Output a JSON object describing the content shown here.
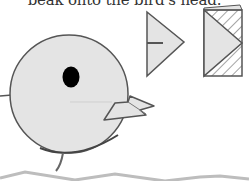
{
  "caption": {
    "text": "beak onto the bird's head."
  },
  "illustration": {
    "subjects": [
      "bird-body",
      "bird-eye",
      "bird-beak",
      "folded-beak-piece",
      "folded-paper-square",
      "ground-line"
    ],
    "colors": {
      "paper_fill": "#e4e4e4",
      "outline": "#555555",
      "eye": "#000000",
      "hatch": "#666666",
      "ground": "#bdbdbd"
    }
  }
}
